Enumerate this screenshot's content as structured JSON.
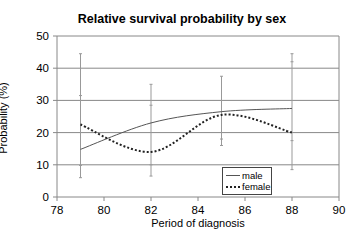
{
  "chart_data": {
    "type": "line",
    "title": "Relative survival probability by sex",
    "xlabel": "Period of diagnosis",
    "ylabel": "Probability (%)",
    "xlim": [
      78,
      90
    ],
    "ylim": [
      0,
      50
    ],
    "x_ticks": [
      78,
      80,
      82,
      84,
      86,
      88,
      90
    ],
    "y_ticks": [
      0,
      10,
      20,
      30,
      40,
      50
    ],
    "grid": "horizontal",
    "legend_position": "lower right inside",
    "x": [
      79,
      82,
      85,
      88
    ],
    "series": [
      {
        "name": "male",
        "style": "solid",
        "color": "#555555",
        "values": [
          14.8,
          23,
          26.5,
          27.5
        ]
      },
      {
        "name": "female",
        "style": "dotted-smoothed",
        "color": "#222222",
        "values": [
          22.5,
          14,
          25.5,
          20
        ]
      }
    ],
    "error_bars": [
      {
        "x": 79,
        "low": 6,
        "high": 44.5,
        "ticks": [
          6,
          9.8,
          31.5,
          44.5
        ]
      },
      {
        "x": 82,
        "low": 6.5,
        "high": 35,
        "ticks": [
          6.5,
          10,
          28.5,
          35
        ]
      },
      {
        "x": 85,
        "low": 16,
        "high": 37.5,
        "ticks": [
          16,
          18,
          37.5
        ]
      },
      {
        "x": 88,
        "low": 8.5,
        "high": 44.5,
        "ticks": [
          8.5,
          17.5,
          42,
          44.5
        ]
      }
    ]
  },
  "labels": {
    "title": "Relative survival probability by sex",
    "xlabel": "Period of diagnosis",
    "ylabel": "Probability (%)",
    "legend_male": "male",
    "legend_female": "female"
  }
}
